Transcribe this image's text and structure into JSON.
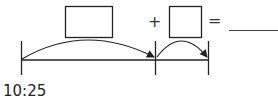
{
  "diagram": {
    "type": "number-line-addition",
    "start_label": "10:25",
    "plus_sign": "+",
    "equals_sign": "=",
    "boxes": [
      {
        "name": "first-addend-box",
        "value": ""
      },
      {
        "name": "second-addend-box",
        "value": ""
      }
    ],
    "answer_blank": "",
    "colors": {
      "stroke": "#222222",
      "background": "#ffffff"
    }
  }
}
